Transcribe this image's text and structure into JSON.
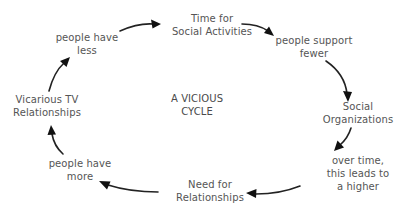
{
  "diagram": {
    "type": "cycle",
    "center": {
      "lines": [
        "A VICIOUS",
        "CYCLE"
      ]
    },
    "nodes": [
      {
        "id": "time",
        "lines": [
          "Time for",
          "Social Activities"
        ]
      },
      {
        "id": "support",
        "lines": [
          "people support",
          "fewer"
        ]
      },
      {
        "id": "orgs",
        "lines": [
          "Social",
          "Organizations"
        ]
      },
      {
        "id": "overtime",
        "lines": [
          "over time,",
          "this leads to",
          "a higher"
        ]
      },
      {
        "id": "need",
        "lines": [
          "Need for",
          "Relationships"
        ]
      },
      {
        "id": "more",
        "lines": [
          "people have",
          "more"
        ]
      },
      {
        "id": "vicarious",
        "lines": [
          "Vicarious TV",
          "Relationships"
        ]
      },
      {
        "id": "less",
        "lines": [
          "people have",
          "less"
        ]
      }
    ],
    "edges": [
      {
        "from": "less",
        "to": "time"
      },
      {
        "from": "time",
        "to": "support"
      },
      {
        "from": "support",
        "to": "orgs"
      },
      {
        "from": "orgs",
        "to": "overtime"
      },
      {
        "from": "overtime",
        "to": "need"
      },
      {
        "from": "need",
        "to": "more"
      },
      {
        "from": "more",
        "to": "vicarious"
      },
      {
        "from": "vicarious",
        "to": "less"
      }
    ],
    "colors": {
      "text": "#555555",
      "arrow": "#222222",
      "background": "#ffffff"
    }
  }
}
